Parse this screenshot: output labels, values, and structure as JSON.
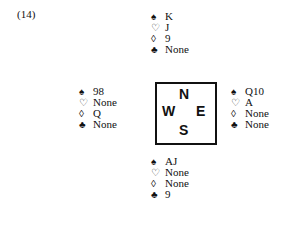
{
  "problem": {
    "number": "(14)"
  },
  "suits": {
    "spades": "♠",
    "hearts": "♡",
    "diamonds": "◊",
    "clubs": "♣"
  },
  "compass": {
    "north": "N",
    "west": "W",
    "east": "E",
    "south": "S"
  },
  "hands": {
    "north": {
      "spades": "K",
      "hearts": "J",
      "diamonds": "9",
      "clubs": "None"
    },
    "west": {
      "spades": "98",
      "hearts": "None",
      "diamonds": "Q",
      "clubs": "None"
    },
    "east": {
      "spades": "Q10",
      "hearts": "A",
      "diamonds": "None",
      "clubs": "None"
    },
    "south": {
      "spades": "AJ",
      "hearts": "None",
      "diamonds": "None",
      "clubs": "9"
    }
  }
}
